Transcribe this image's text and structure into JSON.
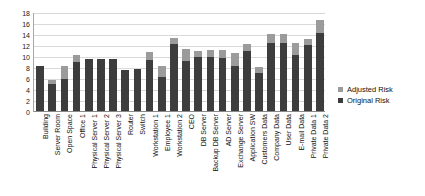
{
  "chart_data": {
    "type": "bar",
    "title": "",
    "xlabel": "",
    "ylabel": "",
    "ylim": [
      0,
      18
    ],
    "ytick_step": 2,
    "yticks": [
      0,
      2,
      4,
      6,
      8,
      10,
      12,
      14,
      16,
      18
    ],
    "grid": true,
    "legend_position": "right",
    "bar_style": "overlapped",
    "categories": [
      "Building",
      "Server Room",
      "Open Space",
      "Office 1",
      "Physical Server 1",
      "Physical Server 2",
      "Physical Server 3",
      "Router",
      "Switch",
      "Workstation 1",
      "Employee 1",
      "Workstation 2",
      "CEO",
      "DB Server",
      "Backup DB Server",
      "AD Server",
      "Exchange Server",
      "Application SW",
      "Customers Data",
      "Company Data",
      "User Data",
      "E-mail Data",
      "Private Data 1",
      "Private Data 2"
    ],
    "series": [
      {
        "name": "Adjusted Risk",
        "color": "#9b9b9b",
        "values": [
          8.1,
          5.7,
          8.1,
          10.1,
          9.5,
          9.5,
          9.5,
          7.5,
          7.6,
          10.7,
          8.2,
          13.2,
          11.3,
          10.9,
          11.1,
          11.1,
          10.6,
          12.2,
          8.0,
          14.0,
          14.0,
          12.4,
          13.1,
          16.5
        ]
      },
      {
        "name": "Original Risk",
        "color": "#3d3d3d",
        "values": [
          8.1,
          5.0,
          5.9,
          9.0,
          9.5,
          9.5,
          9.5,
          7.5,
          7.6,
          9.2,
          6.1,
          12.2,
          9.1,
          9.9,
          9.9,
          9.6,
          8.2,
          11.0,
          7.0,
          12.3,
          12.3,
          10.1,
          12.0,
          14.1
        ]
      }
    ]
  },
  "legend": {
    "entries": [
      {
        "label": "Adjusted Risk",
        "color": "#9b9b9b"
      },
      {
        "label": "Original Risk",
        "color": "#3d3d3d"
      }
    ]
  }
}
